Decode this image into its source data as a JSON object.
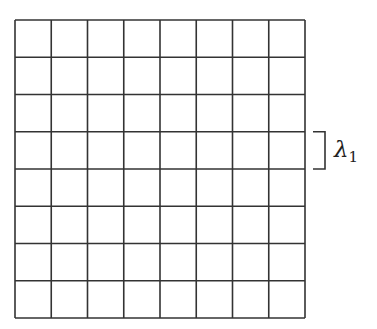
{
  "grid": {
    "rows": 8,
    "cols": 8,
    "left": 15,
    "top": 20,
    "width": 290,
    "height": 298,
    "stroke": "#333333",
    "stroke_width": 1.6
  },
  "bracket": {
    "row_index": 3,
    "x": 313,
    "arm": 12,
    "stroke": "#333333"
  },
  "annotation": {
    "symbol": "λ",
    "subscript": "1"
  }
}
